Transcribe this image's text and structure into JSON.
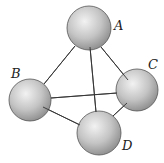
{
  "diagram": {
    "type": "tetrahedron-of-spheres",
    "colors": {
      "sphere_light": "#f2f2f2",
      "sphere_mid": "#c4c4c4",
      "sphere_dark": "#8a8a8a",
      "edge": "#333333",
      "outline": "#555555"
    },
    "nodes": [
      {
        "id": "A",
        "label": "A",
        "cx": 89,
        "cy": 28,
        "r": 22,
        "lx": 114,
        "ly": 30
      },
      {
        "id": "B",
        "label": "B",
        "cx": 30,
        "cy": 100,
        "r": 21,
        "lx": 11,
        "ly": 78
      },
      {
        "id": "C",
        "label": "C",
        "cx": 137,
        "cy": 90,
        "r": 21,
        "lx": 148,
        "ly": 69
      },
      {
        "id": "D",
        "label": "D",
        "cx": 99,
        "cy": 133,
        "r": 22,
        "lx": 122,
        "ly": 150
      }
    ],
    "edges": [
      {
        "from": "A",
        "to": "B",
        "x1": 75,
        "y1": 46,
        "x2": 44,
        "y2": 84
      },
      {
        "from": "A",
        "to": "C",
        "x1": 101,
        "y1": 47,
        "x2": 128,
        "y2": 80
      },
      {
        "from": "A",
        "to": "D",
        "x1": 90,
        "y1": 47,
        "x2": 96,
        "y2": 112
      },
      {
        "from": "B",
        "to": "C",
        "x1": 51,
        "y1": 98,
        "x2": 117,
        "y2": 93
      },
      {
        "from": "B",
        "to": "D",
        "x1": 43,
        "y1": 107,
        "x2": 80,
        "y2": 125
      },
      {
        "from": "C",
        "to": "D",
        "x1": 127,
        "y1": 103,
        "x2": 113,
        "y2": 116
      }
    ]
  }
}
